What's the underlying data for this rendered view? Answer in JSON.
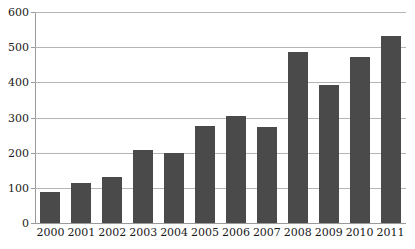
{
  "chart_data": {
    "type": "bar",
    "title": "",
    "subtitle": "",
    "xlabel": "",
    "ylabel": "",
    "categories": [
      "2000",
      "2001",
      "2002",
      "2003",
      "2004",
      "2005",
      "2006",
      "2007",
      "2008",
      "2009",
      "2010",
      "2011"
    ],
    "values": [
      88,
      113,
      130,
      209,
      200,
      275,
      303,
      274,
      487,
      392,
      473,
      533
    ],
    "series": [
      {
        "name": "",
        "values": [
          88,
          113,
          130,
          209,
          200,
          275,
          303,
          274,
          487,
          392,
          473,
          533
        ]
      }
    ],
    "ylim": [
      0,
      600
    ],
    "y_ticks": [
      0,
      100,
      200,
      300,
      400,
      500,
      600
    ],
    "y_tick_labels": [
      "0",
      "100",
      "200",
      "300",
      "400",
      "500",
      "600"
    ],
    "x_tick_labels": [
      "2000",
      "2001",
      "2002",
      "2003",
      "2004",
      "2005",
      "2006",
      "2007",
      "2008",
      "2009",
      "2010",
      "2011"
    ],
    "grid": true,
    "grid_axis": "y",
    "legend": false,
    "legend_position": "none",
    "annotations": [],
    "colors": {
      "bar": "#4a4a4a",
      "gridline": "#b4b4b4",
      "axis": "#9a9a9a",
      "text": "#1a1a1a",
      "background": "#ffffff"
    }
  }
}
